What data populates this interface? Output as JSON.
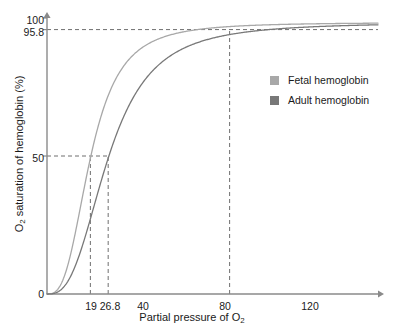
{
  "chart_data": {
    "type": "line",
    "title": "",
    "xlabel": "Partial pressure of O2",
    "ylabel": "O2 saturation of hemoglobin (%)",
    "xlabel_parts": {
      "pre": "Partial pressure of O",
      "sub": "2",
      "post": ""
    },
    "ylabel_parts": {
      "pre": "O",
      "sub": "2",
      "post": " saturation of hemoglobin (%)"
    },
    "xlim": [
      0,
      145
    ],
    "ylim": [
      0,
      100
    ],
    "grid": false,
    "legend_position": "right",
    "x_ticks": [
      {
        "value": 0,
        "label": "0"
      },
      {
        "value": 19,
        "label": "19"
      },
      {
        "value": 26.8,
        "label": "26.8"
      },
      {
        "value": 40,
        "label": "40"
      },
      {
        "value": 80,
        "label": "80"
      },
      {
        "value": 120,
        "label": "120"
      }
    ],
    "y_ticks": [
      {
        "value": 0,
        "label": "0"
      },
      {
        "value": 50,
        "label": "50"
      },
      {
        "value": 95.8,
        "label": "95.8"
      },
      {
        "value": 100,
        "label": "100"
      }
    ],
    "annotations": [
      {
        "name": "saturation-95-8-guide",
        "type": "horizontal-dashed",
        "y": 95.8,
        "x_from": 0,
        "x_to": 145
      },
      {
        "name": "saturation-50-guide",
        "type": "horizontal-dashed",
        "y": 50,
        "x_from": 0,
        "x_to": 26.8
      },
      {
        "name": "p50-fetal-guide",
        "type": "vertical-dashed",
        "x": 19,
        "y_from": 0,
        "y_to": 50
      },
      {
        "name": "p50-adult-guide",
        "type": "vertical-dashed",
        "x": 26.8,
        "y_from": 0,
        "y_to": 50
      },
      {
        "name": "p80-guide",
        "type": "vertical-dashed",
        "x": 80,
        "y_from": 0,
        "y_to": 95.8
      }
    ],
    "series": [
      {
        "name": "Fetal hemoglobin",
        "color": "#a8a8a8",
        "p50": 19,
        "hill_n": 2.9,
        "x": [
          0,
          2,
          4,
          6,
          8,
          10,
          12,
          14,
          16,
          19,
          22,
          26.8,
          30,
          35,
          40,
          50,
          60,
          70,
          80,
          100,
          120,
          145
        ],
        "y": [
          0,
          1.5,
          5.2,
          10.6,
          17.3,
          24.6,
          32.1,
          39.3,
          46.0,
          50.0,
          61.5,
          71.5,
          76.3,
          82.3,
          86.4,
          91.7,
          94.3,
          95.2,
          95.8,
          96.7,
          97.4,
          98.1
        ]
      },
      {
        "name": "Adult hemoglobin",
        "color": "#787878",
        "p50": 26.8,
        "hill_n": 2.8,
        "x": [
          0,
          2,
          4,
          6,
          8,
          10,
          12,
          14,
          16,
          19,
          22,
          26.8,
          30,
          35,
          40,
          50,
          60,
          70,
          80,
          100,
          120,
          145
        ],
        "y": [
          0,
          0.6,
          2.2,
          4.6,
          7.8,
          11.6,
          15.9,
          20.5,
          25.3,
          32.4,
          39.2,
          50.0,
          56.3,
          65.0,
          72.0,
          82.0,
          88.0,
          92.0,
          95.6,
          96.6,
          97.3,
          98.0
        ]
      }
    ],
    "legend": [
      {
        "label": "Fetal hemoglobin",
        "color": "#a8a8a8"
      },
      {
        "label": "Adult hemoglobin",
        "color": "#787878"
      }
    ],
    "axis_color": "#8a8a8a",
    "dash_color": "#6f6f6f",
    "text_color": "#1a1a1a"
  }
}
